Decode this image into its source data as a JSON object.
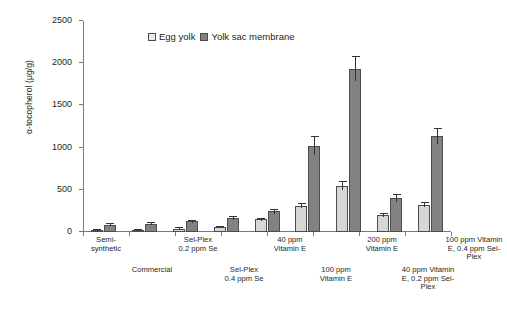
{
  "chart_data": {
    "type": "bar",
    "title": "",
    "xlabel": "",
    "ylabel": "α-tocopherol (μg/g)",
    "ylim": [
      0,
      2500
    ],
    "yticks": [
      0,
      500,
      1000,
      1500,
      2000,
      2500
    ],
    "grid": false,
    "legend_position": "top-center",
    "categories": [
      "Semi-\nsynthetic",
      "Commercial",
      "Sel-Plex\n0.2 ppm Se",
      "Sel-Plex\n0.4 ppm Se",
      "40 ppm\nVitamin E",
      "100 ppm\nVitamin E",
      "200 ppm\nVitamin E",
      "40 ppm Vitamin\nE, 0.2 ppm Sel-\nPlex",
      "100 ppm Vitamin\nE, 0.4 ppm Sel-\nPlex"
    ],
    "series": [
      {
        "name": "Egg yolk",
        "color": "#d6d6d6",
        "values": [
          20,
          25,
          40,
          60,
          150,
          310,
          550,
          205,
          325
        ],
        "errors": [
          12,
          12,
          14,
          16,
          22,
          28,
          50,
          22,
          26
        ]
      },
      {
        "name": "Yolk sac membrane",
        "color": "#828282",
        "values": [
          85,
          100,
          125,
          165,
          245,
          1025,
          1935,
          400,
          1135
        ],
        "errors": [
          18,
          18,
          20,
          24,
          30,
          110,
          150,
          45,
          95
        ]
      }
    ],
    "legend": [
      "Egg yolk",
      "Yolk sac membrane"
    ],
    "note": "Eight x-axis tick groups; labels alternate between two rows under the axis."
  },
  "axis": {
    "y_labels": [
      "0",
      "500",
      "1000",
      "1500",
      "2000",
      "2500"
    ],
    "y_title": "α-tocopherol (μg/g)"
  },
  "legend": {
    "egg_yolk": "Egg yolk",
    "yolk_sac_membrane": "Yolk sac membrane"
  },
  "xlabels_row1": [
    "Semi-\nsynthetic",
    "Sel-Plex\n0.2 ppm Se",
    "40 ppm\nVitamin E",
    "200 ppm\nVitamin E",
    "100 ppm Vitamin\nE, 0.4 ppm Sel-\nPlex"
  ],
  "xlabels_row2": [
    "Commercial",
    "Sel-Plex\n0.4 ppm Se",
    "100 ppm\nVitamin E",
    "40 ppm Vitamin\nE, 0.2 ppm Sel-\nPlex"
  ]
}
